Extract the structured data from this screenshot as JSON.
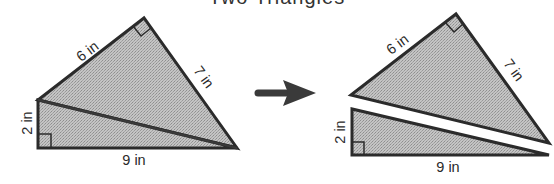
{
  "caption": "Two Triangles",
  "colors": {
    "fill": "#b9b9b9",
    "stroke": "#2b2b2b",
    "arrow": "#3a3a3a",
    "text": "#2a2a2a"
  },
  "before": {
    "label_top_left": "6 in",
    "label_top_right": "7 in",
    "label_left": "2 in",
    "label_bottom": "9 in"
  },
  "arrow": {
    "direction": "right"
  },
  "after": {
    "upper_triangle": {
      "label_left_side": "6 in",
      "label_right_side": "7 in"
    },
    "lower_triangle": {
      "label_left": "2 in",
      "label_bottom": "9 in"
    }
  }
}
